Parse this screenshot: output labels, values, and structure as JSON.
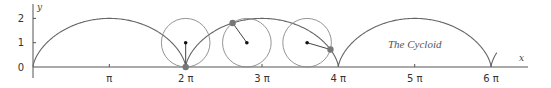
{
  "chart_data": {
    "type": "line",
    "title": "The Cycloid",
    "xlabel": "x",
    "ylabel": "y",
    "xlim": [
      0,
      20.2
    ],
    "ylim": [
      0,
      2
    ],
    "grid": false,
    "legend": null,
    "x_ticks": [
      {
        "value": 3.1416,
        "label": "π"
      },
      {
        "value": 6.2832,
        "label": "2 π"
      },
      {
        "value": 9.4248,
        "label": "3 π"
      },
      {
        "value": 12.5664,
        "label": "4 π"
      },
      {
        "value": 15.708,
        "label": "5 π"
      },
      {
        "value": 18.8496,
        "label": "6 π"
      }
    ],
    "y_ticks": [
      {
        "value": 0,
        "label": "0"
      },
      {
        "value": 1,
        "label": "1"
      },
      {
        "value": 2,
        "label": "2"
      }
    ],
    "series": [
      {
        "name": "cycloid",
        "equation": "x = t - sin t, y = 1 - cos t",
        "r": 1,
        "t_range": [
          0,
          20.0
        ]
      }
    ],
    "rolling_circles": [
      {
        "theta": 6.2832,
        "center": [
          6.2832,
          1
        ],
        "point": [
          6.2832,
          0
        ]
      },
      {
        "theta": 8.8,
        "center": [
          8.8,
          1
        ],
        "point": [
          8.22,
          1.81
        ]
      },
      {
        "theta": 11.28,
        "center": [
          11.28,
          1
        ],
        "point": [
          12.22,
          0.66
        ]
      }
    ],
    "colors": {
      "curve": "#666666",
      "axis": "#555555",
      "point": "#777777",
      "dot": "#111111"
    }
  }
}
